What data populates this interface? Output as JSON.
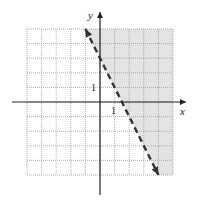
{
  "chart_data": {
    "type": "line",
    "title": "",
    "xlabel": "x",
    "ylabel": "y",
    "xlim": [
      -5,
      5
    ],
    "ylim": [
      -5,
      5
    ],
    "grid": true,
    "tick_labels": {
      "x": "1",
      "y": "1"
    },
    "series": [
      {
        "name": "boundary line y = -2x + 3",
        "style": "dashed",
        "arrows": "both",
        "x": [
          -1,
          4
        ],
        "y": [
          5,
          -5
        ]
      }
    ],
    "shaded_region": "y > -2x + 3 (right of / above the line)",
    "colors": {
      "shade": "#e3e3e3",
      "grid": "#9a9a9a",
      "axis": "#222222",
      "line": "#333333"
    }
  }
}
